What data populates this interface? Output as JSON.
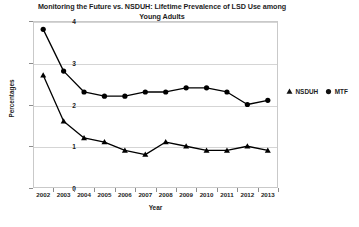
{
  "chart_data": {
    "type": "line",
    "title": "Monitoring the Future vs. NSDUH: Lifetime Prevalence of LSD Use among Young Adults",
    "title_lines": [
      "Monitoring the Future vs. NSDUH: Lifetime Prevalence of LSD Use among",
      "Young Adults"
    ],
    "xlabel": "Year",
    "ylabel": "Percentages",
    "categories": [
      "2002",
      "2003",
      "2004",
      "2005",
      "2006",
      "2007",
      "2008",
      "2009",
      "2010",
      "2011",
      "2012",
      "2013"
    ],
    "x": [
      2002,
      2003,
      2004,
      2005,
      2006,
      2007,
      2008,
      2009,
      2010,
      2011,
      2012,
      2013
    ],
    "ylim": [
      0,
      4
    ],
    "yticks": [
      "0",
      "1",
      "2",
      "3",
      "4"
    ],
    "ytick_values": [
      0,
      1,
      2,
      3,
      4
    ],
    "grid": true,
    "grid_axis": "y",
    "legend_position": "right",
    "series": [
      {
        "name": "NSDUH",
        "marker": "triangle",
        "color": "#000000",
        "values": [
          2.7,
          1.6,
          1.2,
          1.1,
          0.9,
          0.8,
          1.1,
          1.0,
          0.9,
          0.9,
          1.0,
          0.9
        ]
      },
      {
        "name": "MTF",
        "marker": "circle",
        "color": "#000000",
        "values": [
          3.8,
          2.8,
          2.3,
          2.2,
          2.2,
          2.3,
          2.3,
          2.4,
          2.4,
          2.3,
          2.0,
          2.1
        ]
      }
    ]
  },
  "legend": {
    "entries": [
      {
        "label": "NSDUH",
        "marker": "triangle-marker-icon"
      },
      {
        "label": "MTF",
        "marker": "circle-marker-icon"
      }
    ]
  }
}
